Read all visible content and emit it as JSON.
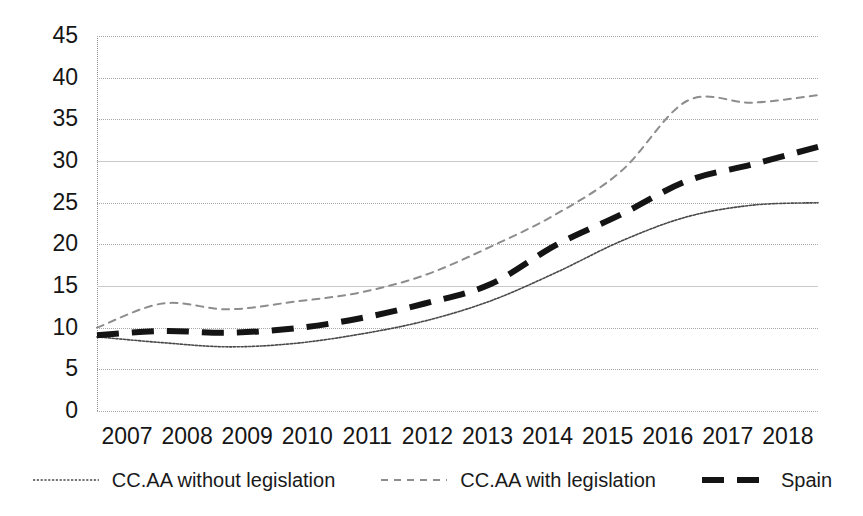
{
  "chart_data": {
    "type": "line",
    "title": "",
    "subtitle": "",
    "xlabel": "",
    "ylabel": "",
    "x": [
      2007,
      2008,
      2009,
      2010,
      2011,
      2012,
      2013,
      2014,
      2015,
      2016,
      2017,
      2018
    ],
    "xlim": [
      2007,
      2018
    ],
    "ylim": [
      0,
      45
    ],
    "ytick_labels": [
      "45",
      "40",
      "35",
      "30",
      "25",
      "20",
      "15",
      "10",
      "5",
      "0"
    ],
    "ytick_values": [
      45,
      40,
      35,
      30,
      25,
      20,
      15,
      10,
      5,
      0
    ],
    "ystep": 5,
    "xtick_labels": [
      "2007",
      "2008",
      "2009",
      "2010",
      "2011",
      "2012",
      "2013",
      "2014",
      "2015",
      "2016",
      "2017",
      "2018"
    ],
    "grid": true,
    "grid_axis": "y",
    "legend_position": "bottom",
    "series": [
      {
        "name": "CC.AA  without legislation",
        "style": "fine-dotted",
        "color": "#4a4a4a",
        "width": 1.6,
        "values": [
          8.9,
          8.2,
          7.7,
          8.1,
          9.2,
          10.8,
          13.2,
          16.6,
          20.4,
          23.3,
          24.7,
          25.0
        ]
      },
      {
        "name": "CC.AA with legislation",
        "style": "dashed-light",
        "color": "#8d8d8d",
        "width": 2.0,
        "values": [
          10.0,
          12.9,
          12.2,
          13.1,
          14.2,
          16.3,
          19.7,
          23.6,
          28.8,
          37.2,
          37.0,
          37.9
        ]
      },
      {
        "name": "Spain",
        "style": "thick-dashed",
        "color": "#141414",
        "width": 6.0,
        "values": [
          9.1,
          9.6,
          9.4,
          9.9,
          11.1,
          12.9,
          15.2,
          19.9,
          23.6,
          27.6,
          29.6,
          31.7
        ]
      }
    ]
  },
  "legend": {
    "items": [
      {
        "label": "CC.AA  without legislation",
        "swatch": "fine-dotted-swatch"
      },
      {
        "label": "CC.AA with legislation",
        "swatch": "dashed-light-swatch"
      },
      {
        "label": "Spain",
        "swatch": "thick-dashed-swatch"
      }
    ]
  },
  "colors": {
    "series_without": "#4a4a4a",
    "series_with": "#8d8d8d",
    "series_spain": "#141414",
    "grid": "#a8a8a8",
    "text": "#161616",
    "background": "#ffffff"
  }
}
